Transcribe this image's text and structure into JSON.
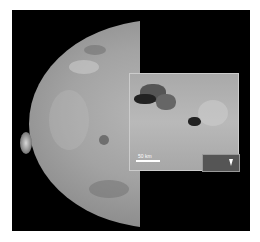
{
  "image": {
    "subject": "Io (moon of Jupiter) with close-up inset of volcanic region",
    "inset": {
      "scale_label": "50 km",
      "sub_inset_label": "Galileo 1999"
    }
  }
}
